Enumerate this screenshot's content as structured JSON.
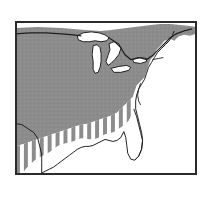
{
  "figure": {
    "kind": "thematic-range-map",
    "region_label": "Eastern and Central United States",
    "frame": {
      "x": 15,
      "y": 21,
      "width": 182,
      "height": 154,
      "border_color": "#2a2a2a",
      "border_width_px": 1,
      "background_color": "#ffffff"
    },
    "canvas": {
      "width": 212,
      "height": 198,
      "background_color": "#ffffff"
    }
  },
  "map": {
    "title": "",
    "projection_note": "",
    "layers": [
      {
        "id": "solid-range",
        "name": "Solid shaded distribution area",
        "fill_color": "#8c8c8c",
        "pattern": "solid-gray-dither",
        "description": "Continuous gray shading covering the northern, midwestern and northeastern United States, extending west beyond the map frame and reaching the Atlantic coast from Maine south through the Carolinas."
      },
      {
        "id": "hatched-range",
        "name": "Vertically hatched distribution area",
        "fill_color": "#8c8c8c",
        "pattern": "vertical-stripes",
        "stripe_width_px": 4,
        "stripe_gap_px": 4,
        "description": "Vertical stripe hatching along the southern margin of the range, spanning the southern Great Plains, Texas, the Gulf Coast states and the Deep South."
      },
      {
        "id": "unshaded-area",
        "name": "Unshaded land outside the range",
        "fill_color": "#ffffff",
        "pattern": "none",
        "description": "White land area outside the distribution, including Florida's interior margin, the southern Gulf coastal plain and the Atlantic coastal lowlands of the Southeast."
      },
      {
        "id": "great-lakes",
        "name": "Great Lakes water bodies",
        "fill_color": "#ffffff",
        "outline_color": "#1f1f1f",
        "description": "White water bodies of Lake Superior, Lake Michigan, Lake Huron, Lake Erie and Lake Ontario, outlined in black."
      },
      {
        "id": "coastline",
        "name": "Coastline and national boundary",
        "stroke_color": "#1f1f1f",
        "stroke_width_px": 1,
        "description": "Black outline tracing the Atlantic and Gulf coastlines, the Canada-United States border along the 49th parallel and the Great Lakes, and the Mexican border."
      }
    ],
    "colors": {
      "shaded_gray": "#8c8c8c",
      "hatch_gray": "#8c8c8c",
      "water_white": "#ffffff",
      "outline_black": "#1f1f1f",
      "frame_black": "#2a2a2a",
      "page_white": "#ffffff"
    },
    "features": [
      {
        "name": "Lake Superior",
        "type": "lake"
      },
      {
        "name": "Lake Michigan",
        "type": "lake"
      },
      {
        "name": "Lake Huron",
        "type": "lake"
      },
      {
        "name": "Lake Erie",
        "type": "lake"
      },
      {
        "name": "Lake Ontario",
        "type": "lake"
      },
      {
        "name": "Florida Peninsula",
        "type": "peninsula"
      },
      {
        "name": "Gulf of Mexico",
        "type": "sea"
      },
      {
        "name": "Atlantic Ocean",
        "type": "ocean"
      },
      {
        "name": "Canada-United States border",
        "type": "boundary"
      },
      {
        "name": "Chesapeake Bay",
        "type": "bay"
      },
      {
        "name": "Cape Cod",
        "type": "cape"
      },
      {
        "name": "Maine",
        "type": "state"
      }
    ],
    "labels": []
  },
  "legend": {
    "visible": false,
    "entries": [
      {
        "swatch": "solid-gray",
        "label": ""
      },
      {
        "swatch": "vertical-hatch",
        "label": ""
      }
    ]
  }
}
